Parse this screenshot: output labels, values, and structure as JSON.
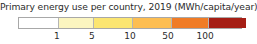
{
  "legend": {
    "title": "Primary energy use per country, 2019 (MWh/capita/year)",
    "title_color": "#2b2b2b",
    "background": "#ffffff",
    "border_color": "#a8a8a8"
  },
  "chart_data": {
    "type": "heatmap",
    "title": "Primary energy use per country, 2019 (MWh/capita/year)",
    "xlabel": "",
    "ylabel": "",
    "variable": "Primary energy use per country",
    "year": "2019",
    "units": "MWh/capita/year",
    "scale": "log",
    "orientation": "horizontal",
    "legend_position": "bottom",
    "grid": false,
    "tick_labels": [
      "1",
      "5",
      "10",
      "50",
      "100"
    ],
    "tick_values": [
      1,
      5,
      10,
      50,
      100
    ],
    "tick_positions_pct": [
      17.4,
      33.0,
      50.0,
      67.0,
      83.5
    ],
    "bin_edges": [
      null,
      1,
      5,
      10,
      50,
      100,
      null
    ],
    "colors": [
      "#ffffff",
      "#fbf5c0",
      "#fbe571",
      "#fdbe52",
      "#f07c26",
      "#a51e15"
    ],
    "bins": [
      {
        "label": "< 1",
        "color": "#ffffff",
        "width_pct": 17.4
      },
      {
        "label": "1 – 5",
        "color": "#fbf5c0",
        "width_pct": 15.6
      },
      {
        "label": "5 – 10",
        "color": "#fbe571",
        "width_pct": 17.0
      },
      {
        "label": "10 – 50",
        "color": "#fdbe52",
        "width_pct": 17.0
      },
      {
        "label": "50 – 100",
        "color": "#f07c26",
        "width_pct": 16.5
      },
      {
        "label": "> 100",
        "color": "#a51e15",
        "width_pct": 16.5
      }
    ]
  }
}
